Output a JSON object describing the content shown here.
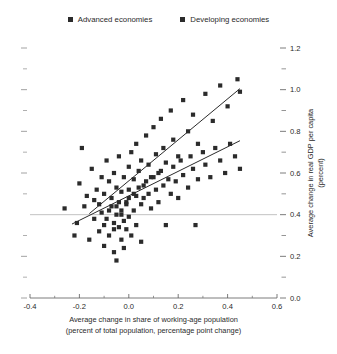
{
  "legend": {
    "items": [
      {
        "label": "Advanced economies",
        "color": "#2b2b2b",
        "marker": "square-marker"
      },
      {
        "label": "Developing economies",
        "color": "#2b2b2b",
        "marker": "square-marker"
      }
    ]
  },
  "chart_data": {
    "type": "scatter",
    "title": "",
    "xlabel": "Average change in share of working-age population",
    "xlabel_line2": "(percent of total population, percentage point change)",
    "ylabel": "Average change in real GDP per capita",
    "ylabel_line2": "(percent)",
    "xlim": [
      -0.4,
      0.6
    ],
    "ylim": [
      0.0,
      1.2
    ],
    "x_major_ticks": [
      -0.4,
      -0.2,
      0.0,
      0.2,
      0.4,
      0.6
    ],
    "x_major_tick_labels": [
      "-0.4",
      "-0.2",
      "0.0",
      "0.2",
      "0.4",
      "0.6"
    ],
    "x_minor_ticks": [
      -0.3,
      -0.1,
      0.1,
      0.3,
      0.5
    ],
    "y_major_ticks": [
      0.0,
      0.2,
      0.4,
      0.6,
      0.8,
      1.0,
      1.2
    ],
    "y_major_tick_labels": [
      "0.0",
      "0.2",
      "0.4",
      "0.6",
      "0.8",
      "1.0",
      "1.2"
    ],
    "y_minor_ticks": [
      0.1,
      0.3,
      0.5,
      0.7,
      0.9,
      1.1
    ],
    "y_axis_side": "right",
    "left_axis_ticks_unlabeled": true,
    "grid": false,
    "reference_line_y": 0.4,
    "reference_line_color": "#b4b4b4",
    "legend_position": "top-center",
    "marker_color": "#2b2b2b",
    "marker_size_px": 4.2,
    "trendline_color": "#2b2b2b",
    "series": [
      {
        "name": "Advanced economies",
        "color": "#2b2b2b",
        "trendline": {
          "x": [
            -0.16,
            0.45
          ],
          "y": [
            0.405,
            1.005
          ]
        },
        "points": [
          [
            -0.26,
            0.43
          ],
          [
            -0.22,
            0.3
          ],
          [
            -0.2,
            0.55
          ],
          [
            -0.19,
            0.72
          ],
          [
            -0.17,
            0.49
          ],
          [
            -0.15,
            0.62
          ],
          [
            -0.14,
            0.38
          ],
          [
            -0.13,
            0.52
          ],
          [
            -0.12,
            0.45
          ],
          [
            -0.11,
            0.58
          ],
          [
            -0.1,
            0.35
          ],
          [
            -0.1,
            0.5
          ],
          [
            -0.09,
            0.66
          ],
          [
            -0.08,
            0.42
          ],
          [
            -0.08,
            0.56
          ],
          [
            -0.07,
            0.48
          ],
          [
            -0.06,
            0.6
          ],
          [
            -0.06,
            0.33
          ],
          [
            -0.05,
            0.53
          ],
          [
            -0.05,
            0.44
          ],
          [
            -0.04,
            0.68
          ],
          [
            -0.03,
            0.51
          ],
          [
            -0.03,
            0.4
          ],
          [
            -0.02,
            0.58
          ],
          [
            -0.01,
            0.46
          ],
          [
            0.0,
            0.63
          ],
          [
            0.0,
            0.52
          ],
          [
            0.01,
            0.7
          ],
          [
            0.02,
            0.57
          ],
          [
            0.03,
            0.49
          ],
          [
            0.03,
            0.74
          ],
          [
            0.04,
            0.61
          ],
          [
            0.05,
            0.66
          ],
          [
            0.06,
            0.54
          ],
          [
            0.07,
            0.78
          ],
          [
            0.08,
            0.64
          ],
          [
            0.09,
            0.58
          ],
          [
            0.1,
            0.82
          ],
          [
            0.11,
            0.69
          ],
          [
            0.12,
            0.6
          ],
          [
            0.13,
            0.86
          ],
          [
            0.14,
            0.72
          ],
          [
            0.15,
            0.65
          ],
          [
            0.17,
            0.9
          ],
          [
            0.18,
            0.76
          ],
          [
            0.2,
            0.68
          ],
          [
            0.22,
            0.95
          ],
          [
            0.24,
            0.8
          ],
          [
            0.26,
            0.88
          ],
          [
            0.28,
            0.74
          ],
          [
            0.31,
            0.98
          ],
          [
            0.34,
            0.85
          ],
          [
            0.37,
            1.02
          ],
          [
            0.4,
            0.92
          ],
          [
            0.44,
            1.05
          ],
          [
            0.45,
            0.99
          ]
        ]
      },
      {
        "name": "Developing economies",
        "color": "#2b2b2b",
        "trendline": {
          "x": [
            -0.23,
            0.45
          ],
          "y": [
            0.355,
            0.755
          ]
        },
        "points": [
          [
            -0.21,
            0.36
          ],
          [
            -0.18,
            0.44
          ],
          [
            -0.16,
            0.28
          ],
          [
            -0.14,
            0.47
          ],
          [
            -0.12,
            0.32
          ],
          [
            -0.11,
            0.41
          ],
          [
            -0.1,
            0.25
          ],
          [
            -0.09,
            0.38
          ],
          [
            -0.08,
            0.3
          ],
          [
            -0.07,
            0.44
          ],
          [
            -0.06,
            0.36
          ],
          [
            -0.06,
            0.22
          ],
          [
            -0.05,
            0.4
          ],
          [
            -0.05,
            0.18
          ],
          [
            -0.04,
            0.34
          ],
          [
            -0.04,
            0.46
          ],
          [
            -0.03,
            0.28
          ],
          [
            -0.03,
            0.42
          ],
          [
            -0.02,
            0.37
          ],
          [
            -0.02,
            0.24
          ],
          [
            -0.01,
            0.45
          ],
          [
            -0.01,
            0.33
          ],
          [
            0.0,
            0.48
          ],
          [
            0.0,
            0.39
          ],
          [
            0.01,
            0.3
          ],
          [
            0.02,
            0.5
          ],
          [
            0.02,
            0.42
          ],
          [
            0.03,
            0.35
          ],
          [
            0.04,
            0.53
          ],
          [
            0.05,
            0.45
          ],
          [
            0.05,
            0.27
          ],
          [
            0.06,
            0.48
          ],
          [
            0.07,
            0.56
          ],
          [
            0.08,
            0.5
          ],
          [
            0.09,
            0.43
          ],
          [
            0.1,
            0.58
          ],
          [
            0.11,
            0.52
          ],
          [
            0.12,
            0.46
          ],
          [
            0.13,
            0.61
          ],
          [
            0.14,
            0.54
          ],
          [
            0.15,
            0.35
          ],
          [
            0.16,
            0.57
          ],
          [
            0.17,
            0.5
          ],
          [
            0.18,
            0.63
          ],
          [
            0.19,
            0.56
          ],
          [
            0.2,
            0.48
          ],
          [
            0.21,
            0.66
          ],
          [
            0.22,
            0.59
          ],
          [
            0.24,
            0.53
          ],
          [
            0.25,
            0.68
          ],
          [
            0.26,
            0.62
          ],
          [
            0.27,
            0.35
          ],
          [
            0.28,
            0.57
          ],
          [
            0.3,
            0.7
          ],
          [
            0.31,
            0.64
          ],
          [
            0.33,
            0.58
          ],
          [
            0.35,
            0.72
          ],
          [
            0.37,
            0.66
          ],
          [
            0.39,
            0.6
          ],
          [
            0.41,
            0.74
          ],
          [
            0.43,
            0.68
          ],
          [
            0.45,
            0.62
          ]
        ]
      }
    ]
  }
}
